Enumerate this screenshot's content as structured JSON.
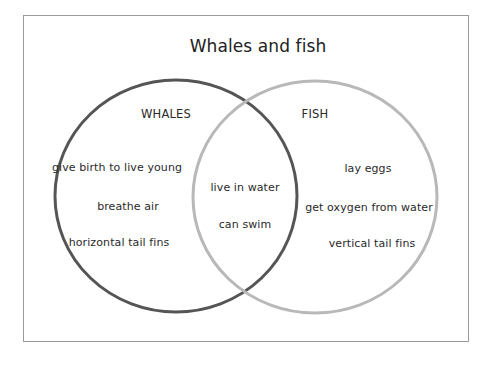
{
  "diagram": {
    "title": "Whales and fish",
    "type": "venn",
    "sets": [
      {
        "name": "WHALES",
        "stroke_color": "#555555",
        "unique_items": [
          "give birth to live young",
          "breathe air",
          "horizontal tail fins"
        ]
      },
      {
        "name": "FISH",
        "stroke_color": "#b8b8b8",
        "unique_items": [
          "lay eggs",
          "get oxygen from water",
          "vertical tail fins"
        ]
      }
    ],
    "intersection_items": [
      "live in water",
      "can swim"
    ],
    "frame_color": "#9a9a9a"
  }
}
